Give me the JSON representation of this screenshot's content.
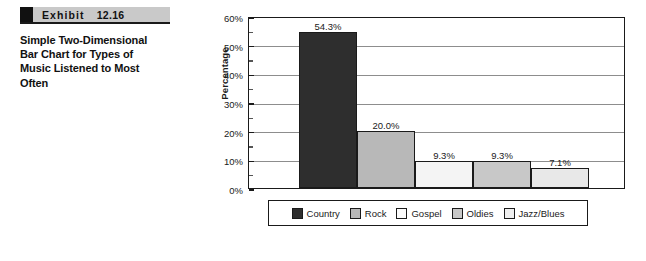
{
  "exhibit": {
    "label": "Exhibit",
    "number": "12.16",
    "title": "Simple Two-Dimensional Bar Chart for Types of Music Listened to Most Often"
  },
  "chart_data": {
    "type": "bar",
    "title": "",
    "xlabel": "",
    "ylabel": "Percentage",
    "categories": [
      "Country",
      "Rock",
      "Gospel",
      "Oldies",
      "Jazz/Blues"
    ],
    "values": [
      54.3,
      20.0,
      9.3,
      9.3,
      7.1
    ],
    "data_labels": [
      "54.3%",
      "20.0%",
      "9.3%",
      "9.3%",
      "7.1%"
    ],
    "ylim": [
      0,
      60
    ],
    "yticks": [
      0,
      10,
      20,
      30,
      40,
      50,
      60
    ],
    "ytick_labels": [
      "0%",
      "10%",
      "20%",
      "30%",
      "40%",
      "50%",
      "60%"
    ],
    "minor_tick_interval": 5,
    "grid": true,
    "legend_position": "bottom",
    "series_colors": [
      "#2e2e2e",
      "#b8b8b8",
      "#f4f4f4",
      "#c8c8c8",
      "#e8e8e8"
    ]
  },
  "legend": {
    "items": [
      {
        "label": "Country",
        "color": "#2e2e2e"
      },
      {
        "label": "Rock",
        "color": "#b8b8b8"
      },
      {
        "label": "Gospel",
        "color": "#fbfbfb"
      },
      {
        "label": "Oldies",
        "color": "#c8c8c8"
      },
      {
        "label": "Jazz/Blues",
        "color": "#efefef"
      }
    ]
  }
}
